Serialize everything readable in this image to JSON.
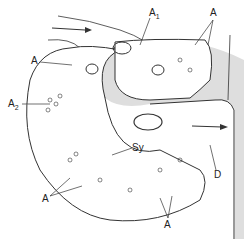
{
  "figure": {
    "type": "histological line drawing",
    "labels": {
      "a1": {
        "main": "A",
        "sub": "1"
      },
      "a_top_right": "A",
      "a_left": "A",
      "a2": {
        "main": "A",
        "sub": "2"
      },
      "sy": "Sy",
      "d": "D",
      "a_bottom_left": "A",
      "a_bottom": "A"
    },
    "colors": {
      "line": "#333333",
      "dendrite_fill": "#dcdcdc",
      "background": "#ffffff"
    }
  }
}
